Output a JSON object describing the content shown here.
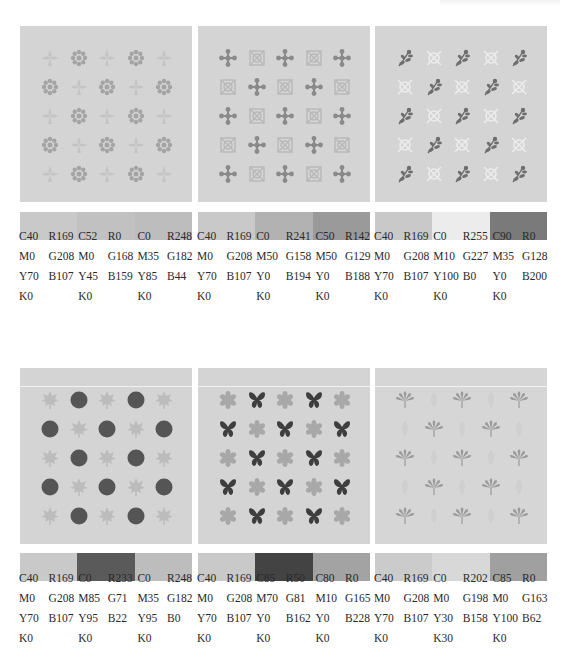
{
  "page": {
    "header_text": ""
  },
  "palettes": [
    {
      "id": "palette-1",
      "motifs": {
        "a": "rosette-icon",
        "b": "fleur-icon"
      },
      "motif_colors": {
        "background": "#d4d4d4",
        "a": "#a4a4a4",
        "b": "#c4c4c4"
      },
      "swatch_colors": [
        "#c9c9c9",
        "#c1c1c1",
        "#bdbdbd"
      ],
      "colors": [
        {
          "cmyk": [
            "C40",
            "M0",
            "Y70",
            "K0"
          ],
          "rgb": [
            "R169",
            "G208",
            "B107"
          ]
        },
        {
          "cmyk": [
            "C52",
            "M0",
            "Y45",
            "K0"
          ],
          "rgb": [
            "R0",
            "G168",
            "B159"
          ]
        },
        {
          "cmyk": [
            "C0",
            "M35",
            "Y85",
            "K0"
          ],
          "rgb": [
            "R248",
            "G182",
            "B44"
          ]
        }
      ]
    },
    {
      "id": "palette-2",
      "motifs": {
        "a": "ornate-tile-icon",
        "b": "dot-cross-icon"
      },
      "motif_colors": {
        "background": "#d4d4d4",
        "a": "#b8b8b8",
        "b": "#8a8a8a"
      },
      "swatch_colors": [
        "#c9c9c9",
        "#b2b2b2",
        "#9a9a9a"
      ],
      "colors": [
        {
          "cmyk": [
            "C40",
            "M0",
            "Y70",
            "K0"
          ],
          "rgb": [
            "R169",
            "G208",
            "B107"
          ]
        },
        {
          "cmyk": [
            "C0",
            "M50",
            "Y0",
            "K0"
          ],
          "rgb": [
            "R241",
            "G158",
            "B194"
          ]
        },
        {
          "cmyk": [
            "C50",
            "M50",
            "Y0",
            "K0"
          ],
          "rgb": [
            "R142",
            "G129",
            "B188"
          ]
        }
      ]
    },
    {
      "id": "palette-3",
      "motifs": {
        "a": "light-knot-icon",
        "b": "sprig-icon"
      },
      "motif_colors": {
        "background": "#d4d4d4",
        "a": "#ececec",
        "b": "#6e6e6e"
      },
      "swatch_colors": [
        "#c9c9c9",
        "#ececec",
        "#7a7a7a"
      ],
      "colors": [
        {
          "cmyk": [
            "C40",
            "M0",
            "Y70",
            "K0"
          ],
          "rgb": [
            "R169",
            "G208",
            "B107"
          ]
        },
        {
          "cmyk": [
            "C0",
            "M10",
            "Y100",
            "K0"
          ],
          "rgb": [
            "R255",
            "G227",
            "B0"
          ]
        },
        {
          "cmyk": [
            "C90",
            "M35",
            "Y0",
            "K0"
          ],
          "rgb": [
            "R0",
            "G128",
            "B200"
          ]
        }
      ]
    },
    {
      "id": "palette-4",
      "motifs": {
        "a": "round-flower-icon",
        "b": "maple-leaf-icon"
      },
      "motif_colors": {
        "background": "#d4d4d4",
        "a": "#555555",
        "b": "#bcbcbc"
      },
      "swatch_colors": [
        "#c9c9c9",
        "#5a5a5a",
        "#bdbdbd"
      ],
      "colors": [
        {
          "cmyk": [
            "C40",
            "M0",
            "Y70",
            "K0"
          ],
          "rgb": [
            "R169",
            "G208",
            "B107"
          ]
        },
        {
          "cmyk": [
            "C0",
            "M85",
            "Y95",
            "K0"
          ],
          "rgb": [
            "R233",
            "G71",
            "B22"
          ]
        },
        {
          "cmyk": [
            "C0",
            "M35",
            "Y95",
            "K0"
          ],
          "rgb": [
            "R248",
            "G182",
            "B0"
          ]
        }
      ]
    },
    {
      "id": "palette-5",
      "motifs": {
        "a": "butterfly-icon",
        "b": "star-flower-icon"
      },
      "motif_colors": {
        "background": "#d4d4d4",
        "a": "#3e3e3e",
        "b": "#a8a8a8"
      },
      "swatch_colors": [
        "#c9c9c9",
        "#434343",
        "#a3a3a3"
      ],
      "colors": [
        {
          "cmyk": [
            "C40",
            "M0",
            "Y70",
            "K0"
          ],
          "rgb": [
            "R169",
            "G208",
            "B107"
          ]
        },
        {
          "cmyk": [
            "C85",
            "M70",
            "Y0",
            "K0"
          ],
          "rgb": [
            "R50",
            "G81",
            "B162"
          ]
        },
        {
          "cmyk": [
            "C80",
            "M10",
            "Y0",
            "K0"
          ],
          "rgb": [
            "R0",
            "G165",
            "B228"
          ]
        }
      ]
    },
    {
      "id": "palette-6",
      "motifs": {
        "a": "faint-leaf-icon",
        "b": "hemp-leaf-icon"
      },
      "motif_colors": {
        "background": "#d6d6d6",
        "a": "#cfcfcf",
        "b": "#9a9a9a"
      },
      "swatch_colors": [
        "#cbcbcb",
        "#d8d8d8",
        "#a0a0a0"
      ],
      "colors": [
        {
          "cmyk": [
            "C40",
            "M0",
            "Y70",
            "K0"
          ],
          "rgb": [
            "R169",
            "G208",
            "B107"
          ]
        },
        {
          "cmyk": [
            "C0",
            "M0",
            "Y30",
            "K30"
          ],
          "rgb": [
            "R202",
            "G198",
            "B158"
          ]
        },
        {
          "cmyk": [
            "C85",
            "M0",
            "Y100",
            "K0"
          ],
          "rgb": [
            "R0",
            "G163",
            "B62"
          ]
        }
      ]
    }
  ]
}
